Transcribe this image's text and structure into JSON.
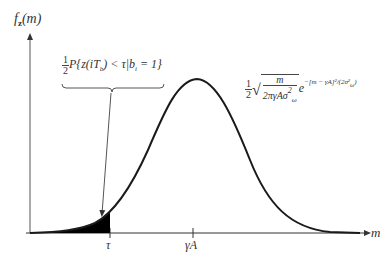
{
  "y_axis_label": {
    "main": "f",
    "sub": "z",
    "arg": "(m)"
  },
  "x_axis_label": "m",
  "ticks": [
    {
      "label": "τ",
      "x": 110
    },
    {
      "label": "γA",
      "x": 193
    }
  ],
  "tail_annotation": {
    "coefficient_num": "1",
    "coefficient_den": "2",
    "expression": "P{z(iT",
    "sub_b": "b",
    "expression_mid": ") < τ|b",
    "sub_i": "i",
    "expression_end": " = 1}"
  },
  "pdf_formula": {
    "coefficient_num": "1",
    "coefficient_den": "2",
    "sqrt_num": "m",
    "sqrt_den": "2πγAσ",
    "sqrt_den_sup": "2",
    "sqrt_den_sub": "ω",
    "exp_base": "e",
    "exponent": "−[m − γA]²/(2σ²",
    "exponent_sub": "ω",
    "exponent_end": ")"
  },
  "colors": {
    "curve": "#1a1a1a",
    "axis": "#333333",
    "fill": "#000000"
  }
}
